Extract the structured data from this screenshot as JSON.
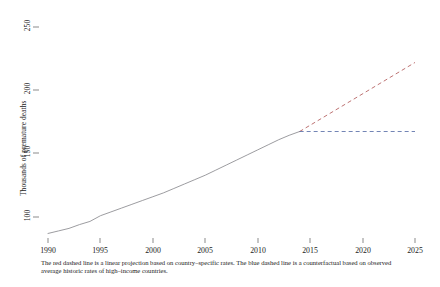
{
  "chart_data": {
    "type": "line",
    "title": "",
    "xlabel": "",
    "ylabel": "Thousands of premature deaths",
    "xlim": [
      1990,
      2025
    ],
    "ylim": [
      85,
      255
    ],
    "xticks": [
      1990,
      1995,
      2000,
      2005,
      2010,
      2015,
      2020,
      2025
    ],
    "yticks": [
      100,
      150,
      200,
      250
    ],
    "xtick_labels": [
      "1990",
      "1995",
      "2000",
      "2005",
      "2010",
      "2015",
      "2020",
      "2025"
    ],
    "ytick_labels": [
      "100",
      "150",
      "200",
      "250"
    ],
    "grid": false,
    "legend": "none",
    "series": [
      {
        "name": "Observed premature deaths",
        "style": "solid",
        "color": "#8a8a8f",
        "x": [
          1990,
          1991,
          1992,
          1993,
          1994,
          1995,
          1996,
          1997,
          1998,
          1999,
          2000,
          2001,
          2002,
          2003,
          2004,
          2005,
          2006,
          2007,
          2008,
          2009,
          2010,
          2011,
          2012,
          2013,
          2014
        ],
        "values": [
          87,
          89,
          91,
          94,
          96.5,
          101,
          104,
          107,
          110,
          113,
          116,
          119,
          122.5,
          126,
          129.5,
          133,
          137,
          141,
          145,
          149,
          153,
          157,
          161,
          164.5,
          167.5
        ]
      },
      {
        "name": "Linear projection based on country-specific rates",
        "style": "dashed",
        "color": "#b15a5a",
        "x": [
          2014,
          2025
        ],
        "values": [
          167.5,
          222
        ]
      },
      {
        "name": "Counterfactual based on high-income country rates",
        "style": "dashed",
        "color": "#5a6fa8",
        "x": [
          2014,
          2025
        ],
        "values": [
          167.5,
          167.5
        ]
      }
    ],
    "annotations": {
      "branch_year": 2014,
      "branch_value": 167.5
    },
    "caption": "The red dashed line is a linear projection based on country–specific rates. The blue dashed line is a counterfactual based on observed average historic rates of high–income countries."
  }
}
